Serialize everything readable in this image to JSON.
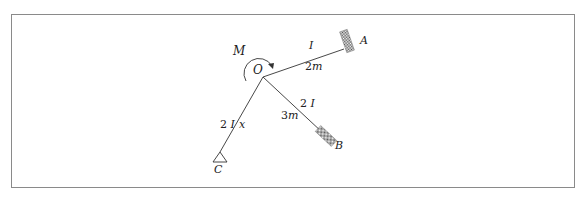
{
  "diagram": {
    "type": "structural-frame",
    "joint": {
      "label": "O"
    },
    "moment": {
      "label": "M",
      "direction": "clockwise"
    },
    "members": [
      {
        "id": "OA",
        "end_label": "A",
        "support": "fixed",
        "stiffness": "I",
        "length": "2m"
      },
      {
        "id": "OB",
        "end_label": "B",
        "support": "fixed",
        "stiffness": "2I",
        "length": "3m"
      },
      {
        "id": "OC",
        "end_label": "C",
        "support": "pinned",
        "stiffness": "2I",
        "length": "x"
      }
    ]
  },
  "labels": {
    "O": "O",
    "M": "M",
    "A": "A",
    "B": "B",
    "C": "C",
    "OA_stiffness": "I",
    "OA_length_num": "2",
    "OA_length_unit": "m",
    "OB_stiffness": "2I",
    "OB_length_num": "3",
    "OB_length_unit": "m",
    "OC_stiffness": "2I",
    "OC_length": "x"
  }
}
